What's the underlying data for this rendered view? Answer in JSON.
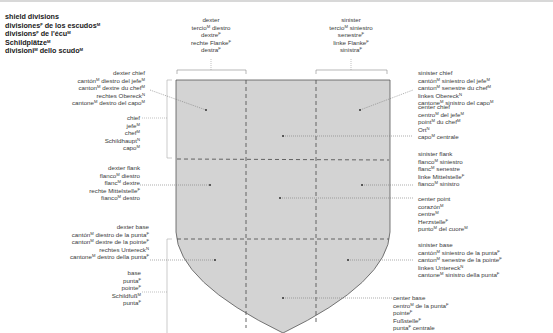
{
  "title": {
    "lines": [
      {
        "text": "shield divisions",
        "sup": ""
      },
      {
        "text": "divisiones",
        "sup": "F",
        "rest": " de los escudos",
        "sup2": "M"
      },
      {
        "text": "divisions",
        "sup": "F",
        "rest": " de l'écu",
        "sup2": "M"
      },
      {
        "text": "Schildplätze",
        "sup": "M"
      },
      {
        "text": "divisioni",
        "sup": "M",
        "rest": " dello scudo",
        "sup2": "M"
      }
    ]
  },
  "labels": {
    "dexter": {
      "l1": "dexter",
      "l2a": "tercio",
      "l2s": "M",
      "l2b": " diestro",
      "l3a": "dextre",
      "l3s": "F",
      "l4a": "rechte Flanke",
      "l4s": "F",
      "l5a": "destra",
      "l5s": "F"
    },
    "sinister": {
      "l1": "sinister",
      "l2a": "tercio",
      "l2s": "M",
      "l2b": " siniestro",
      "l3a": "senestre",
      "l3s": "F",
      "l4a": "linke Flanke",
      "l4s": "F",
      "l5a": "sinistra",
      "l5s": "F"
    },
    "dexter_chief": {
      "l1": "dexter chief",
      "l2a": "cantón",
      "l2s": "M",
      "l2b": " diestro del jefe",
      "l2s2": "M",
      "l3a": "canton",
      "l3s": "M",
      "l3b": " dextre du chef",
      "l3s2": "M",
      "l4a": "rechtes Obereck",
      "l4s": "N",
      "l5a": "cantone",
      "l5s": "M",
      "l5b": " destro del capo",
      "l5s2": "M"
    },
    "chief": {
      "l1": "chief",
      "l2a": "jefe",
      "l2s": "M",
      "l3a": "chef",
      "l3s": "M",
      "l4a": "Schildhaupt",
      "l4s": "N",
      "l5a": "capo",
      "l5s": "M"
    },
    "dexter_flank": {
      "l1": "dexter flank",
      "l2a": "flanco",
      "l2s": "M",
      "l2b": " diestro",
      "l3a": "flanc",
      "l3s": "M",
      "l3b": " dextre",
      "l4a": "rechte Mittelstelle",
      "l4s": "F",
      "l5a": "fianco",
      "l5s": "M",
      "l5b": " destro"
    },
    "dexter_base": {
      "l1": "dexter base",
      "l2a": "cantón",
      "l2s": "M",
      "l2b": " diestro de la punta",
      "l2s2": "F",
      "l3a": "canton",
      "l3s": "M",
      "l3b": " dextre de la pointe",
      "l3s2": "F",
      "l4a": "rechtes Untereck",
      "l4s": "N",
      "l5a": "cantone",
      "l5s": "M",
      "l5b": " destro della punta",
      "l5s2": "F"
    },
    "base": {
      "l1": "base",
      "l2a": "punta",
      "l2s": "F",
      "l3a": "pointe",
      "l3s": "F",
      "l4a": "Schildfuß",
      "l4s": "M",
      "l5a": "punta",
      "l5s": "F"
    },
    "sinister_chief": {
      "l1": "sinister chief",
      "l2a": "cantón",
      "l2s": "M",
      "l2b": " siniestro del jefe",
      "l2s2": "M",
      "l3a": "canton",
      "l3s": "M",
      "l3b": " senestre du chef",
      "l3s2": "M",
      "l4a": "linkes Obereck",
      "l4s": "N",
      "l5a": "cantone",
      "l5s": "M",
      "l5b": " sinistro del capo",
      "l5s2": "M"
    },
    "center_chief": {
      "l1": "center chief",
      "l2a": "centro",
      "l2s": "M",
      "l2b": " del jefe",
      "l2s2": "M",
      "l3a": "point",
      "l3s": "M",
      "l3b": " du chef",
      "l3s2": "M",
      "l4a": "Ort",
      "l4s": "N",
      "l5a": "capo",
      "l5s": "M",
      "l5b": " centrale"
    },
    "sinister_flank": {
      "l1": "sinister flank",
      "l2a": "flanco",
      "l2s": "M",
      "l2b": " siniestro",
      "l3a": "flanc",
      "l3s": "M",
      "l3b": " senestre",
      "l4a": "linke Mittelstelle",
      "l4s": "F",
      "l5a": "fianco",
      "l5s": "M",
      "l5b": " sinistro"
    },
    "center_point": {
      "l1": "center point",
      "l2a": "corazón",
      "l2s": "M",
      "l3a": "centre",
      "l3s": "M",
      "l4a": "Herzstelle",
      "l4s": "F",
      "l5a": "punto",
      "l5s": "M",
      "l5b": " del cuore",
      "l5s2": "M"
    },
    "sinister_base": {
      "l1": "sinister base",
      "l2a": "cantón",
      "l2s": "M",
      "l2b": " siniestro de la punta",
      "l2s2": "F",
      "l3a": "canton",
      "l3s": "M",
      "l3b": " senestre de la pointe",
      "l3s2": "F",
      "l4a": "linkes Untereck",
      "l4s": "N",
      "l5a": "cantone",
      "l5s": "M",
      "l5b": " sinistro della punta",
      "l5s2": "F"
    },
    "center_base": {
      "l1": "center base",
      "l2a": "centro",
      "l2s": "M",
      "l2b": " de la punta",
      "l2s2": "F",
      "l3a": "pointe",
      "l3s": "F",
      "l4a": "Fußstelle",
      "l4s": "F",
      "l5a": "punta",
      "l5s": "F",
      "l5b": " centrale"
    }
  },
  "colors": {
    "shield_fill": "#d3d3d3",
    "shield_stroke": "#555555",
    "leader": "#777777",
    "text": "#3a3a3a"
  }
}
